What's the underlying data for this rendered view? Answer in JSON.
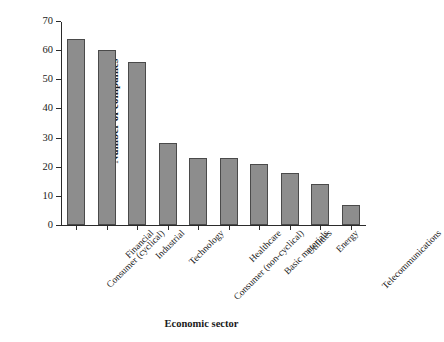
{
  "chart_data": {
    "type": "bar",
    "title": "",
    "xlabel": "Economic sector",
    "ylabel": "Number of companies",
    "categories": [
      "Consumer (cyclical)",
      "Financial",
      "Industrial",
      "Technology",
      "Consumer (non-cyclical)",
      "Healthcare",
      "Basic materials",
      "Utilities",
      "Energy",
      "Telecommunications"
    ],
    "values": [
      64,
      60,
      56,
      28,
      23,
      23,
      21,
      18,
      14,
      7
    ],
    "ylim": [
      0,
      70
    ],
    "yticks": [
      0,
      10,
      20,
      30,
      40,
      50,
      60,
      70
    ],
    "ytick_labels": [
      "0",
      "10",
      "20",
      "30",
      "40",
      "50",
      "60",
      "70"
    ],
    "grid": false,
    "legend": false,
    "bar_color": "#8d8d8d",
    "bar_edge_color": "#4a4a4a",
    "axis_color": "#2b2b2b"
  }
}
